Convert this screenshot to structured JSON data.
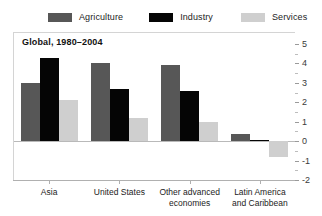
{
  "legend": {
    "items": [
      {
        "label": "Agriculture",
        "color": "#575757",
        "key": "agriculture"
      },
      {
        "label": "Industry",
        "color": "#050505",
        "key": "industry"
      },
      {
        "label": "Services",
        "color": "#cfcfcf",
        "key": "services"
      }
    ]
  },
  "chart_data": {
    "type": "bar",
    "title": "Global, 1980–2004",
    "xlabel": "",
    "ylabel": "",
    "ylim": [
      -2,
      5
    ],
    "yticks": [
      5,
      4,
      3,
      2,
      1,
      0,
      -1,
      -2
    ],
    "ytick_labels": [
      "5",
      "4",
      "3",
      "2",
      "1",
      "0",
      "-1",
      "-2"
    ],
    "minor_ticks": [
      4.5,
      3.5,
      2.5,
      1.5,
      0.5,
      -0.5,
      -1.5
    ],
    "grid": false,
    "legend_position": "top",
    "categories": [
      "Asia",
      "United States",
      "Other advanced\neconomies",
      "Latin America\nand Caribbean"
    ],
    "series": [
      {
        "name": "Agriculture",
        "color": "#575757",
        "values": [
          3.0,
          4.0,
          3.9,
          0.35
        ]
      },
      {
        "name": "Industry",
        "color": "#050505",
        "values": [
          4.3,
          2.7,
          2.6,
          0.05
        ]
      },
      {
        "name": "Services",
        "color": "#cfcfcf",
        "values": [
          2.1,
          1.2,
          1.0,
          -0.8
        ]
      }
    ]
  }
}
